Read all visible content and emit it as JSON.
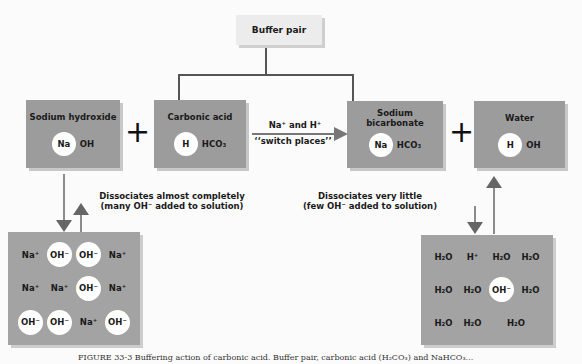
{
  "diagram": {
    "title_box": "Buffer pair",
    "compounds": [
      {
        "name": "Sodium hydroxide",
        "circle": "Na",
        "rest": "OH"
      },
      {
        "name": "Carbonic acid",
        "circle": "H",
        "rest": "HCO₃"
      },
      {
        "name": "Sodium bicarbonate",
        "circle": "Na",
        "rest": "HCO₃"
      },
      {
        "name": "Water",
        "circle": "H",
        "rest": "OH"
      }
    ],
    "plus_sign": "+",
    "switch_arrow": {
      "line1": "Na⁺ and H⁺",
      "line2": "‘‘switch places’’"
    },
    "left_note": {
      "line1": "Dissociates almost completely",
      "line2": "(many OH⁻ added to solution)"
    },
    "right_note": {
      "line1": "Dissociates very little",
      "line2": "(few OH⁻ added to solution)"
    },
    "left_solution": {
      "cells": [
        {
          "text": "Na⁺",
          "circle": false
        },
        {
          "text": "OH⁻",
          "circle": true
        },
        {
          "text": "OH⁻",
          "circle": true
        },
        {
          "text": "Na⁺",
          "circle": false
        },
        {
          "text": "Na⁺",
          "circle": false
        },
        {
          "text": "Na⁺",
          "circle": false
        },
        {
          "text": "OH⁻",
          "circle": true
        },
        {
          "text": "Na⁺",
          "circle": false
        },
        {
          "text": "OH⁻",
          "circle": true
        },
        {
          "text": "OH⁻",
          "circle": true
        },
        {
          "text": "Na⁺",
          "circle": false
        },
        {
          "text": "OH⁻",
          "circle": true
        }
      ]
    },
    "right_solution": {
      "cells": [
        {
          "text": "H₂O",
          "circle": false
        },
        {
          "text": "H⁺",
          "circle": false
        },
        {
          "text": "H₂O",
          "circle": false
        },
        {
          "text": "H₂O",
          "circle": false
        },
        {
          "text": "H₂O",
          "circle": false
        },
        {
          "text": "H₂O",
          "circle": false
        },
        {
          "text": "OH⁻",
          "circle": true
        },
        {
          "text": "H₂O",
          "circle": false
        },
        {
          "text": "H₂O",
          "circle": false
        },
        {
          "text": "",
          "circle": false
        },
        {
          "text": "H₂O",
          "circle": false
        },
        {
          "text": "H₂O",
          "circle": false
        }
      ]
    },
    "caption": "FIGURE 33-3  Buffering action of carbonic acid. Buffer pair, carbonic acid (H₂CO₃) and NaHCO₃..."
  },
  "colors": {
    "box_gray": "#9c9c9c",
    "title_box": "#ececec",
    "arrow": "#666666"
  }
}
